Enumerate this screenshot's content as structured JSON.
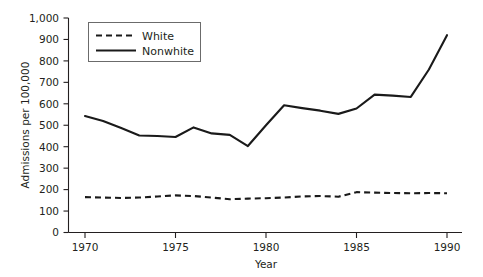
{
  "chart_data": {
    "type": "line",
    "title": "",
    "xlabel": "Year",
    "ylabel": "Admissions per 100,000",
    "xlim": [
      1969,
      1991
    ],
    "ylim": [
      0,
      1000
    ],
    "grid": false,
    "legend_position": "top-left",
    "x": [
      1970,
      1971,
      1972,
      1973,
      1974,
      1975,
      1976,
      1977,
      1978,
      1979,
      1980,
      1981,
      1982,
      1983,
      1984,
      1985,
      1986,
      1987,
      1988,
      1989,
      1990
    ],
    "xticks": [
      "1970",
      "1975",
      "1980",
      "1985",
      "1990"
    ],
    "xtick_values": [
      1970,
      1975,
      1980,
      1985,
      1990
    ],
    "yticks": [
      "0",
      "100",
      "200",
      "300",
      "400",
      "500",
      "600",
      "700",
      "800",
      "900",
      "1,000"
    ],
    "ytick_values": [
      0,
      100,
      200,
      300,
      400,
      500,
      600,
      700,
      800,
      900,
      1000
    ],
    "series": [
      {
        "name": "White",
        "style": "dashed",
        "color": "#1a1a1a",
        "values": [
          165,
          163,
          161,
          163,
          168,
          173,
          170,
          163,
          155,
          158,
          160,
          163,
          168,
          170,
          167,
          188,
          186,
          184,
          183,
          184,
          183
        ]
      },
      {
        "name": "Nonwhite",
        "style": "solid",
        "color": "#1a1a1a",
        "values": [
          543,
          520,
          487,
          452,
          450,
          445,
          490,
          462,
          455,
          403,
          500,
          593,
          580,
          568,
          553,
          578,
          643,
          638,
          632,
          760,
          920
        ]
      }
    ]
  },
  "legend": {
    "entries": [
      {
        "label": "White"
      },
      {
        "label": "Nonwhite"
      }
    ]
  },
  "axes": {
    "y_axis_title": "Admissions per 100,000",
    "x_axis_title": "Year"
  }
}
